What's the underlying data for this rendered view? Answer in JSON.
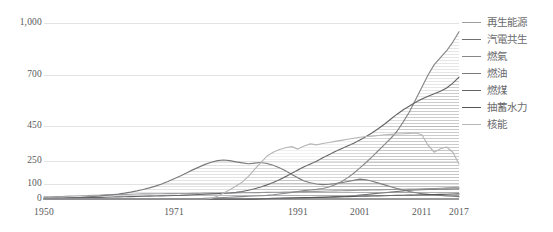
{
  "chart_data": {
    "type": "area",
    "title": "",
    "subtitle": "",
    "xlabel": "",
    "ylabel": "",
    "grid": true,
    "legend_position": "right",
    "x": [
      1950,
      1951,
      1952,
      1953,
      1954,
      1955,
      1956,
      1957,
      1958,
      1959,
      1960,
      1961,
      1962,
      1963,
      1964,
      1965,
      1966,
      1967,
      1968,
      1969,
      1970,
      1971,
      1972,
      1973,
      1974,
      1975,
      1976,
      1977,
      1978,
      1979,
      1980,
      1981,
      1982,
      1983,
      1984,
      1985,
      1986,
      1987,
      1988,
      1989,
      1990,
      1991,
      1992,
      1993,
      1994,
      1995,
      1996,
      1997,
      1998,
      1999,
      2000,
      2001,
      2002,
      2003,
      2004,
      2005,
      2006,
      2007,
      2008,
      2009,
      2010,
      2011,
      2012,
      2013,
      2014,
      2015,
      2016,
      2017
    ],
    "x_ticks": [
      1950,
      1971,
      1991,
      2001,
      2011,
      2017
    ],
    "y_ticks": [
      0,
      100,
      250,
      450,
      700,
      1000
    ],
    "ylim": [
      0,
      1000
    ],
    "y_scale": "nonlinear",
    "series": [
      {
        "name": "再生能源",
        "color": "#9d9d9f",
        "values": [
          14,
          15,
          16,
          17,
          19,
          20,
          22,
          23,
          25,
          26,
          28,
          29,
          30,
          31,
          32,
          33,
          34,
          34,
          35,
          35,
          36,
          36,
          37,
          37,
          38,
          38,
          39,
          39,
          40,
          40,
          41,
          41,
          42,
          42,
          43,
          43,
          44,
          45,
          45,
          46,
          47,
          48,
          49,
          50,
          51,
          52,
          53,
          54,
          55,
          56,
          57,
          58,
          59,
          60,
          61,
          62,
          63,
          64,
          65,
          66,
          67,
          68,
          69,
          70,
          72,
          74,
          76,
          78
        ]
      },
      {
        "name": "汽電共生",
        "color": "#6f6f71",
        "values": [
          0,
          0,
          0,
          0,
          0,
          0,
          0,
          0,
          0,
          0,
          0,
          0,
          0,
          0,
          0,
          0,
          0,
          0,
          0,
          0,
          0,
          0,
          0,
          0,
          0,
          0,
          0,
          0,
          0,
          0,
          0,
          0,
          0,
          1,
          1,
          2,
          2,
          3,
          4,
          5,
          6,
          7,
          8,
          9,
          10,
          11,
          12,
          14,
          16,
          18,
          22,
          26,
          30,
          34,
          38,
          42,
          46,
          50,
          54,
          58,
          60,
          62,
          63,
          64,
          65,
          66,
          67,
          68
        ]
      },
      {
        "name": "燃氣",
        "color": "#87878a",
        "values": [
          0,
          0,
          0,
          0,
          0,
          0,
          0,
          0,
          0,
          0,
          0,
          0,
          0,
          0,
          0,
          0,
          0,
          0,
          0,
          0,
          0,
          0,
          0,
          0,
          0,
          2,
          4,
          6,
          8,
          10,
          12,
          14,
          16,
          18,
          20,
          22,
          24,
          28,
          33,
          38,
          44,
          50,
          56,
          60,
          64,
          70,
          80,
          95,
          115,
          140,
          170,
          205,
          240,
          275,
          310,
          345,
          380,
          420,
          470,
          520,
          580,
          640,
          700,
          760,
          800,
          840,
          890,
          950
        ]
      },
      {
        "name": "燃油",
        "color": "#7a7a7c",
        "values": [
          2,
          3,
          4,
          5,
          7,
          9,
          11,
          14,
          17,
          20,
          24,
          28,
          33,
          39,
          46,
          54,
          63,
          74,
          86,
          100,
          116,
          134,
          152,
          172,
          192,
          210,
          228,
          242,
          252,
          256,
          252,
          244,
          238,
          232,
          236,
          240,
          234,
          222,
          206,
          186,
          162,
          140,
          120,
          108,
          100,
          96,
          98,
          102,
          108,
          116,
          124,
          132,
          128,
          118,
          106,
          94,
          82,
          70,
          60,
          50,
          42,
          36,
          32,
          28,
          24,
          20,
          18,
          16
        ]
      },
      {
        "name": "燃煤",
        "color": "#646466",
        "values": [
          6,
          6,
          7,
          7,
          8,
          8,
          9,
          10,
          10,
          11,
          12,
          13,
          14,
          15,
          16,
          17,
          18,
          19,
          20,
          21,
          22,
          23,
          24,
          26,
          28,
          30,
          32,
          34,
          36,
          38,
          40,
          44,
          50,
          58,
          68,
          80,
          94,
          110,
          128,
          148,
          170,
          192,
          212,
          230,
          248,
          268,
          286,
          304,
          320,
          336,
          352,
          370,
          390,
          412,
          436,
          460,
          484,
          508,
          530,
          548,
          566,
          582,
          596,
          608,
          620,
          636,
          660,
          690
        ]
      },
      {
        "name": "抽蓄水力",
        "color": "#555557",
        "values": [
          0,
          0,
          0,
          0,
          0,
          0,
          0,
          0,
          0,
          0,
          0,
          0,
          0,
          0,
          0,
          0,
          0,
          0,
          0,
          0,
          0,
          0,
          0,
          0,
          0,
          0,
          0,
          0,
          0,
          0,
          0,
          0,
          0,
          0,
          0,
          2,
          3,
          4,
          5,
          6,
          7,
          8,
          9,
          10,
          11,
          12,
          13,
          14,
          15,
          16,
          17,
          18,
          19,
          20,
          21,
          22,
          23,
          24,
          25,
          26,
          27,
          28,
          29,
          30,
          31,
          32,
          33,
          34
        ]
      },
      {
        "name": "核能",
        "color": "#b6b6b8",
        "values": [
          0,
          0,
          0,
          0,
          0,
          0,
          0,
          0,
          0,
          0,
          0,
          0,
          0,
          0,
          0,
          0,
          0,
          0,
          0,
          0,
          0,
          0,
          0,
          0,
          0,
          0,
          0,
          4,
          18,
          40,
          62,
          86,
          112,
          150,
          196,
          240,
          278,
          300,
          316,
          326,
          332,
          318,
          336,
          348,
          342,
          350,
          356,
          362,
          368,
          374,
          380,
          386,
          390,
          392,
          396,
          400,
          402,
          404,
          406,
          408,
          410,
          400,
          340,
          300,
          320,
          330,
          300,
          230
        ]
      }
    ]
  },
  "y_axis": {
    "ticks": [
      {
        "label": "1,000",
        "value": 1000
      },
      {
        "label": "700",
        "value": 700
      },
      {
        "label": "450",
        "value": 450
      },
      {
        "label": "250",
        "value": 250
      },
      {
        "label": "100",
        "value": 100
      },
      {
        "label": "0",
        "value": 0
      }
    ]
  },
  "x_axis": {
    "ticks": [
      {
        "label": "1950",
        "value": 1950
      },
      {
        "label": "1971",
        "value": 1971
      },
      {
        "label": "1991",
        "value": 1991
      },
      {
        "label": "2001",
        "value": 2001
      },
      {
        "label": "2011",
        "value": 2011
      },
      {
        "label": "2017",
        "value": 2017
      }
    ]
  },
  "legend": {
    "items": [
      {
        "label": "再生能源",
        "color": "#9d9d9f"
      },
      {
        "label": "汽電共生",
        "color": "#6f6f71"
      },
      {
        "label": "燃氣",
        "color": "#87878a"
      },
      {
        "label": "燃油",
        "color": "#7a7a7c"
      },
      {
        "label": "燃煤",
        "color": "#646466"
      },
      {
        "label": "抽蓄水力",
        "color": "#555557"
      },
      {
        "label": "核能",
        "color": "#b6b6b8"
      }
    ]
  },
  "style": {
    "grid_color": "#e3e3e4",
    "axis_text_color": "#58585a",
    "background": "#ffffff"
  }
}
